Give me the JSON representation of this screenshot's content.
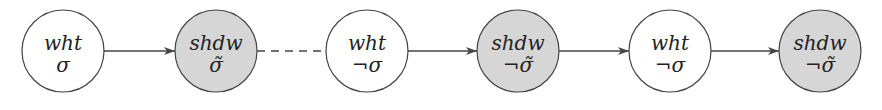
{
  "diagram": {
    "type": "chain",
    "colors": {
      "background": "#ffffff",
      "white_node_fill": "#ffffff",
      "shadow_node_fill": "#d6d6d6",
      "stroke": "#444444",
      "text": "#222222"
    },
    "nodes": [
      {
        "id": "n0",
        "kind": "white",
        "cx": 63,
        "top": "wht",
        "bottom": "σ"
      },
      {
        "id": "n1",
        "kind": "shadow",
        "cx": 216,
        "top": "shdw",
        "bottom": "σ̃"
      },
      {
        "id": "n2",
        "kind": "white",
        "cx": 367,
        "top": "wht",
        "bottom": "¬σ"
      },
      {
        "id": "n3",
        "kind": "shadow",
        "cx": 518,
        "top": "shdw",
        "bottom": "¬σ̃"
      },
      {
        "id": "n4",
        "kind": "white",
        "cx": 670,
        "top": "wht",
        "bottom": "¬σ"
      },
      {
        "id": "n5",
        "kind": "shadow",
        "cx": 820,
        "top": "shdw",
        "bottom": "¬σ̃"
      }
    ],
    "edges": [
      {
        "from": "n0",
        "to": "n1",
        "style": "solid",
        "arrow": true
      },
      {
        "from": "n1",
        "to": "n2",
        "style": "dashed",
        "arrow": false
      },
      {
        "from": "n2",
        "to": "n3",
        "style": "solid",
        "arrow": true
      },
      {
        "from": "n3",
        "to": "n4",
        "style": "solid",
        "arrow": true
      },
      {
        "from": "n4",
        "to": "n5",
        "style": "solid",
        "arrow": true
      }
    ]
  }
}
